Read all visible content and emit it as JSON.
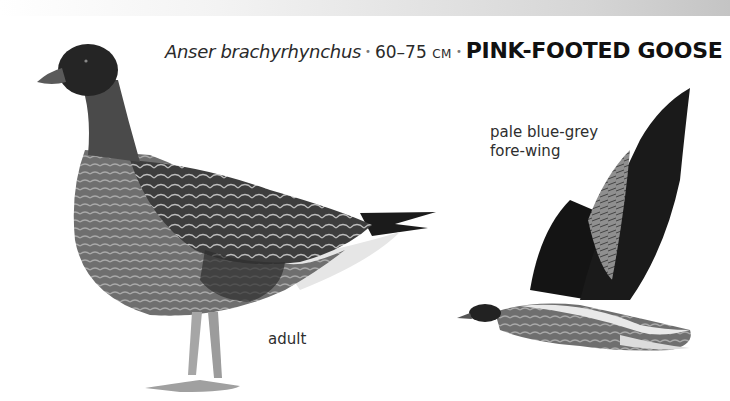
{
  "header": {
    "scientific_name": "Anser brachyrhynchus",
    "separator": "•",
    "size_range": "60–75",
    "size_unit": "CM",
    "common_name": "PINK-FOOTED GOOSE"
  },
  "illustrations": [
    {
      "id": "standing",
      "label": "adult"
    },
    {
      "id": "flying",
      "label_line1": "pale blue-grey",
      "label_line2": "fore-wing"
    }
  ],
  "colors": {
    "head": "#2a2a2a",
    "body": "#7a7a7a",
    "wing_dark": "#1e1e1e",
    "forewing": "#9a9a9a",
    "undertail": "#e8e8e8",
    "legs": "#a8a8a8"
  }
}
